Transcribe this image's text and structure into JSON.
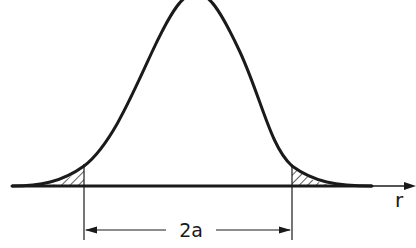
{
  "diagram": {
    "axis_label": "r",
    "dimension_label": "2a",
    "colors": {
      "ink": "#1a1a1a",
      "background": "#ffffff"
    }
  }
}
